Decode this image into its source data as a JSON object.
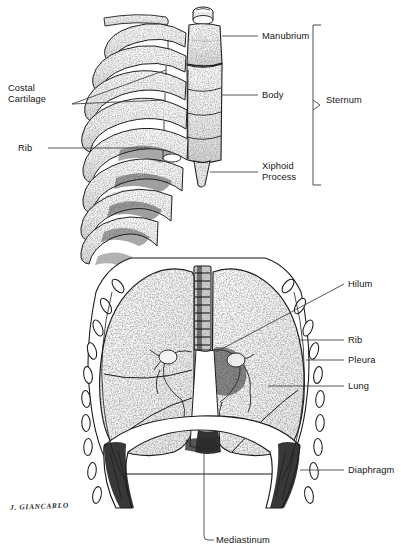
{
  "plate": {
    "title": "Thorax: Sternum, Ribcage, Lungs and Diaphragm",
    "background_color": "#ffffff",
    "ink_color": "#141414",
    "signature": "J. GIANCARLO",
    "medium": "pen-and-ink stipple illustration"
  },
  "figures": [
    {
      "id": "upper",
      "name": "Ribcage and Sternum, anterolateral oblique view",
      "structures": [
        "manubrium",
        "sternal body",
        "xiphoid process",
        "ribs",
        "costal cartilage"
      ]
    },
    {
      "id": "lower",
      "name": "Thoracic cavity, anterior view",
      "structures": [
        "trachea",
        "lungs",
        "hilum",
        "pleura",
        "ribs in cross-section",
        "diaphragm",
        "mediastinum"
      ]
    }
  ],
  "labels": {
    "manubrium": "Manubrium",
    "body": "Body",
    "xiphoid_line1": "Xiphoid",
    "xiphoid_line2": "Process",
    "sternum": "Sternum",
    "costal_line1": "Costal",
    "costal_line2": "Cartilage",
    "rib_upper": "Rib",
    "hilum": "Hilum",
    "rib_lower": "Rib",
    "pleura": "Pleura",
    "lung": "Lung",
    "diaphragm": "Diaphragm",
    "mediastinum": "Mediastinum"
  },
  "brackets": {
    "sternum_bracket": {
      "top": 25,
      "bottom": 185,
      "arrow": "right-pointing caret at midpoint"
    }
  }
}
